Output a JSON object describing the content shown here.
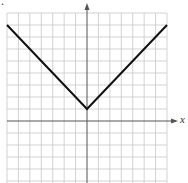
{
  "chart_data": {
    "type": "line",
    "title": "",
    "function": "y = |x| + 1",
    "xlabel": "x",
    "ylabel": "",
    "xlim": [
      -7,
      7
    ],
    "ylim": [
      -5,
      9
    ],
    "grid": true,
    "grid_step": 1,
    "series": [
      {
        "name": "y=|x|+1",
        "x": [
          -7,
          0,
          7
        ],
        "y": [
          8,
          1,
          8
        ]
      }
    ],
    "vertex": [
      0,
      1
    ]
  },
  "labels": {
    "x_axis": "x",
    "corner_mark": "."
  },
  "colors": {
    "grid": "#c8c8c8",
    "axis": "#555555",
    "line": "#111111"
  }
}
